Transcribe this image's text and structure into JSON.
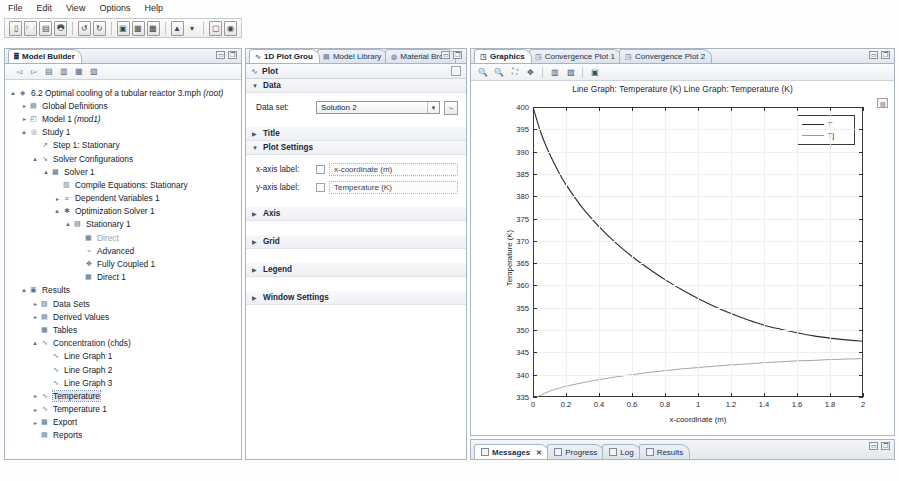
{
  "menubar": {
    "items": [
      "File",
      "Edit",
      "View",
      "Options",
      "Help"
    ]
  },
  "main_toolbar": {
    "icons": [
      "new-file-icon",
      "open-folder-icon",
      "save-icon",
      "print-icon",
      "undo-icon",
      "redo-icon",
      "compute-icon",
      "plot-window-icon",
      "table-window-icon",
      "mesh-icon",
      "dropdown-arrow-icon",
      "copy-icon",
      "help-icon"
    ]
  },
  "model_builder": {
    "tab_label": "Model Builder",
    "tab_icon": "model-builder-icon",
    "panel_controls": [
      "minimize-icon",
      "maximize-icon"
    ],
    "toolbar_icons": [
      "back-arrow-icon",
      "forward-arrow-icon",
      "collapse-all-icon",
      "expand-all-icon",
      "show-hidden-icon",
      "settings-list-icon"
    ],
    "tree": [
      {
        "label": "6.2 Optimal cooling of a tubular reactor 3.mph",
        "suffix": "(root)",
        "indent": 0,
        "twist": "expanded",
        "icon": "model-root-icon"
      },
      {
        "label": "Global Definitions",
        "suffix": "",
        "indent": 1,
        "twist": "collapsed",
        "icon": "global-definitions-icon"
      },
      {
        "label": "Model 1",
        "suffix": "(mod1)",
        "indent": 1,
        "twist": "collapsed",
        "icon": "model-icon"
      },
      {
        "label": "Study 1",
        "suffix": "",
        "indent": 1,
        "twist": "expanded",
        "icon": "study-icon"
      },
      {
        "label": "Step 1: Stationary",
        "suffix": "",
        "indent": 2,
        "twist": "none",
        "icon": "stationary-step-icon"
      },
      {
        "label": "Solver Configurations",
        "suffix": "",
        "indent": 2,
        "twist": "expanded",
        "icon": "solver-configurations-icon"
      },
      {
        "label": "Solver 1",
        "suffix": "",
        "indent": 3,
        "twist": "expanded",
        "icon": "solver-icon"
      },
      {
        "label": "Compile Equations: Stationary",
        "suffix": "",
        "indent": 4,
        "twist": "none",
        "icon": "compile-equations-icon"
      },
      {
        "label": "Dependent Variables 1",
        "suffix": "",
        "indent": 4,
        "twist": "collapsed",
        "icon": "dependent-variables-icon"
      },
      {
        "label": "Optimization Solver 1",
        "suffix": "",
        "indent": 4,
        "twist": "expanded",
        "icon": "optimization-solver-icon"
      },
      {
        "label": "Stationary 1",
        "suffix": "",
        "indent": 5,
        "twist": "expanded",
        "icon": "stationary-solver-icon"
      },
      {
        "label": "Direct",
        "suffix": "",
        "indent": 6,
        "twist": "none",
        "icon": "direct-solver-icon",
        "dim": true
      },
      {
        "label": "Advanced",
        "suffix": "",
        "indent": 6,
        "twist": "none",
        "icon": "advanced-icon"
      },
      {
        "label": "Fully Coupled 1",
        "suffix": "",
        "indent": 6,
        "twist": "none",
        "icon": "fully-coupled-icon"
      },
      {
        "label": "Direct 1",
        "suffix": "",
        "indent": 6,
        "twist": "none",
        "icon": "direct-solver-icon"
      },
      {
        "label": "Results",
        "suffix": "",
        "indent": 1,
        "twist": "expanded",
        "icon": "results-icon"
      },
      {
        "label": "Data Sets",
        "suffix": "",
        "indent": 2,
        "twist": "collapsed",
        "icon": "data-sets-icon"
      },
      {
        "label": "Derived Values",
        "suffix": "",
        "indent": 2,
        "twist": "collapsed",
        "icon": "derived-values-icon"
      },
      {
        "label": "Tables",
        "suffix": "",
        "indent": 2,
        "twist": "none",
        "icon": "tables-icon"
      },
      {
        "label": "Concentration (chds)",
        "suffix": "",
        "indent": 2,
        "twist": "expanded",
        "icon": "plot-group-icon"
      },
      {
        "label": "Line Graph 1",
        "suffix": "",
        "indent": 3,
        "twist": "none",
        "icon": "line-graph-icon"
      },
      {
        "label": "Line Graph 2",
        "suffix": "",
        "indent": 3,
        "twist": "none",
        "icon": "line-graph-icon"
      },
      {
        "label": "Line Graph 3",
        "suffix": "",
        "indent": 3,
        "twist": "none",
        "icon": "line-graph-icon"
      },
      {
        "label": "Temperature",
        "suffix": "",
        "indent": 2,
        "twist": "collapsed",
        "icon": "plot-group-icon",
        "selected": true
      },
      {
        "label": "Temperature 1",
        "suffix": "",
        "indent": 2,
        "twist": "collapsed",
        "icon": "plot-group-icon"
      },
      {
        "label": "Export",
        "suffix": "",
        "indent": 2,
        "twist": "collapsed",
        "icon": "export-icon"
      },
      {
        "label": "Reports",
        "suffix": "",
        "indent": 2,
        "twist": "none",
        "icon": "reports-icon"
      }
    ]
  },
  "settings": {
    "tabs": [
      {
        "label": "1D Plot Grou",
        "icon": "plot-group-icon",
        "active": true
      },
      {
        "label": "Model Library",
        "icon": "model-library-icon",
        "active": false
      },
      {
        "label": "Material Brow",
        "icon": "material-browser-icon",
        "active": false
      }
    ],
    "panel_controls": [
      "minimize-icon",
      "maximize-icon"
    ],
    "header": {
      "title": "Plot",
      "icon": "plot-icon",
      "right_icon": "help-icon"
    },
    "sections": [
      {
        "name": "Data",
        "expanded": true
      },
      {
        "name": "Title",
        "expanded": false
      },
      {
        "name": "Plot Settings",
        "expanded": true
      },
      {
        "name": "Axis",
        "expanded": false
      },
      {
        "name": "Grid",
        "expanded": false
      },
      {
        "name": "Legend",
        "expanded": false
      },
      {
        "name": "Window Settings",
        "expanded": false
      }
    ],
    "data_section": {
      "dataset_label": "Data set:",
      "dataset_value": "Solution 2",
      "dataset_button_icon": "go-to-source-icon"
    },
    "plot_settings": {
      "x_axis_label_label": "x-axis label:",
      "x_axis_label_value": "x-coordinate (m)",
      "y_axis_label_label": "y-axis label:",
      "y_axis_label_value": "Temperature (K)"
    }
  },
  "graphics": {
    "tabs": [
      {
        "label": "Graphics",
        "icon": "graphics-icon",
        "active": true
      },
      {
        "label": "Convergence Plot 1",
        "icon": "convergence-plot-icon",
        "active": false
      },
      {
        "label": "Convergence Plot 2",
        "icon": "convergence-plot-icon",
        "active": false
      }
    ],
    "panel_controls": [
      "minimize-icon",
      "maximize-icon"
    ],
    "toolbar_icons": [
      "zoom-in-icon",
      "zoom-out-icon",
      "zoom-extents-icon",
      "zoom-box-icon",
      "transparency-icon",
      "scene-light-icon",
      "camera-icon"
    ],
    "corner_icon": "plot-corner-icon"
  },
  "bottom": {
    "tabs": [
      {
        "label": "Messages",
        "icon": "messages-icon",
        "active": true,
        "closable": true
      },
      {
        "label": "Progress",
        "icon": "progress-icon",
        "active": false,
        "closable": false
      },
      {
        "label": "Log",
        "icon": "log-icon",
        "active": false,
        "closable": false
      },
      {
        "label": "Results",
        "icon": "results-table-icon",
        "active": false,
        "closable": false
      }
    ],
    "panel_controls": [
      "minimize-icon",
      "maximize-icon"
    ]
  },
  "chart_data": {
    "type": "line",
    "title": "Line Graph: Temperature (K)  Line Graph: Temperature (K)",
    "xlabel": "x-coordinate (m)",
    "ylabel": "Temperature (K)",
    "xlim": [
      0,
      2
    ],
    "ylim": [
      335,
      400
    ],
    "xticks": [
      0,
      0.2,
      0.4,
      0.6,
      0.8,
      1,
      1.2,
      1.4,
      1.6,
      1.8,
      2
    ],
    "xtick_labels": [
      "0",
      "0.2",
      "0.4",
      "0.6",
      "0.8",
      "1",
      "1.2",
      "1.4",
      "1.6",
      "1.8",
      "2"
    ],
    "yticks": [
      335,
      340,
      345,
      350,
      355,
      360,
      365,
      370,
      375,
      380,
      385,
      390,
      395,
      400
    ],
    "ytick_labels": [
      "335",
      "340",
      "345",
      "350",
      "355",
      "360",
      "365",
      "370",
      "375",
      "380",
      "385",
      "390",
      "395",
      "400"
    ],
    "grid": true,
    "legend_position": "upper right",
    "series": [
      {
        "name": "T",
        "color": "#2b2b2b",
        "style": "solid",
        "x": [
          0,
          0.05,
          0.1,
          0.15,
          0.2,
          0.3,
          0.4,
          0.5,
          0.6,
          0.7,
          0.8,
          0.9,
          1.0,
          1.1,
          1.2,
          1.3,
          1.4,
          1.5,
          1.6,
          1.7,
          1.8,
          1.9,
          2.0
        ],
        "y": [
          400.0,
          394.0,
          389.5,
          385.8,
          382.6,
          377.4,
          373.2,
          369.6,
          366.5,
          363.8,
          361.3,
          359.1,
          357.1,
          355.3,
          353.7,
          352.3,
          351.1,
          350.2,
          349.4,
          348.7,
          348.2,
          347.8,
          347.5
        ]
      },
      {
        "name": "Tj",
        "color": "#9b9b9b",
        "style": "solid",
        "x": [
          0,
          0.05,
          0.1,
          0.15,
          0.2,
          0.3,
          0.4,
          0.5,
          0.6,
          0.7,
          0.8,
          0.9,
          1.0,
          1.1,
          1.2,
          1.3,
          1.4,
          1.5,
          1.6,
          1.7,
          1.8,
          1.9,
          2.0
        ],
        "y": [
          334.5,
          335.5,
          336.3,
          336.9,
          337.4,
          338.2,
          338.9,
          339.5,
          340.0,
          340.5,
          340.9,
          341.3,
          341.6,
          341.9,
          342.2,
          342.4,
          342.7,
          342.9,
          343.1,
          343.2,
          343.4,
          343.5,
          343.6
        ]
      }
    ]
  }
}
